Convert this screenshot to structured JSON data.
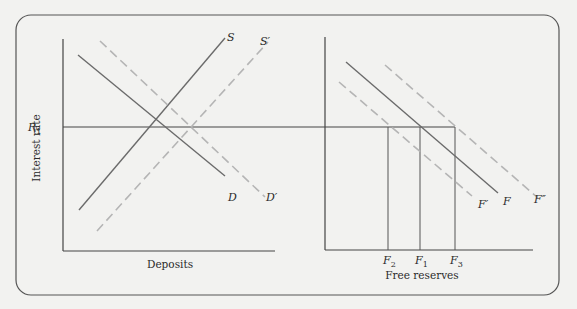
{
  "colors": {
    "background": "#f2f2f0",
    "frame": "#555555",
    "axis": "#444444",
    "solid_line": "#6b6b6b",
    "dashed_line": "#b5b5b5",
    "text": "#2a2a2a"
  },
  "left_panel": {
    "y_axis_label": "Interest rate",
    "x_axis_label": "Deposits",
    "r1_label": "R",
    "r1_sub": "1",
    "curves": {
      "S": {
        "label": "S",
        "style": "solid"
      },
      "S_prime": {
        "label": "S′",
        "style": "dashed"
      },
      "D": {
        "label": "D",
        "style": "solid"
      },
      "D_prime": {
        "label": "D′",
        "style": "dashed"
      }
    }
  },
  "right_panel": {
    "x_axis_label": "Free reserves",
    "ticks": [
      {
        "label": "F",
        "sub": "2"
      },
      {
        "label": "F",
        "sub": "1"
      },
      {
        "label": "F",
        "sub": "3"
      }
    ],
    "curves": {
      "F": {
        "label": "F",
        "style": "solid"
      },
      "F_prime": {
        "label": "F′",
        "style": "dashed"
      },
      "F_double_prime": {
        "label": "F″",
        "style": "dashed"
      }
    }
  }
}
